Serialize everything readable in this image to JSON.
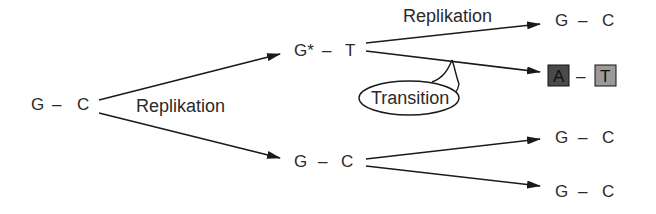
{
  "diagram": {
    "type": "flow",
    "source_pair": {
      "text": "G  –  C",
      "left": "G",
      "bond": "–",
      "right": "C"
    },
    "first_replication_label": "Replikation",
    "upper_branch": {
      "pair": {
        "left": "G*",
        "bond": "–",
        "right": "T"
      },
      "replication_label": "Replikation",
      "transition_label": "Transition",
      "products": [
        {
          "left": "G",
          "bond": "–",
          "right": "C",
          "highlighted": false
        },
        {
          "left": "A",
          "bond": "–",
          "right": "T",
          "highlighted": true
        }
      ]
    },
    "lower_branch": {
      "pair": {
        "left": "G",
        "bond": "–",
        "right": "C"
      },
      "products": [
        {
          "left": "G",
          "bond": "–",
          "right": "C"
        },
        {
          "left": "G",
          "bond": "–",
          "right": "C"
        }
      ]
    },
    "colors": {
      "line": "#1a1a1a",
      "text": "#2a2a2a",
      "box_A": "#4a4a4a",
      "box_T": "#9a9a9a"
    }
  }
}
